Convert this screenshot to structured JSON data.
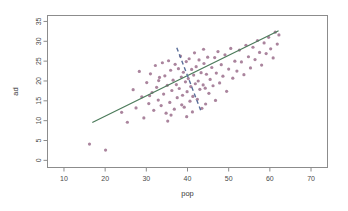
{
  "chart_data": {
    "type": "scatter",
    "title": "",
    "xlabel": "pop",
    "ylabel": "ad",
    "xlim": [
      6,
      74
    ],
    "ylim": [
      -1.8,
      36.5
    ],
    "xticks": [
      10,
      20,
      30,
      40,
      50,
      60,
      70
    ],
    "yticks": [
      0,
      5,
      10,
      15,
      20,
      25,
      30,
      35
    ],
    "xtick_labels": [
      "10",
      "20",
      "30",
      "40",
      "50",
      "60",
      "70"
    ],
    "ytick_labels": [
      "0",
      "5",
      "10",
      "15",
      "20",
      "25",
      "30",
      "35"
    ],
    "grid": false,
    "legend": null,
    "point_color": "#9b6e8c",
    "point_radius": 1.6,
    "series": [
      {
        "name": "observations",
        "color": "#9b6e8c",
        "x": [
          16.2,
          20.1,
          24.0,
          25.4,
          26.8,
          27.5,
          28.3,
          28.9,
          29.4,
          30.1,
          30.6,
          31.0,
          31.4,
          31.8,
          32.2,
          32.5,
          32.9,
          33.2,
          33.6,
          33.9,
          34.2,
          34.5,
          34.8,
          35.1,
          35.4,
          35.7,
          35.9,
          36.2,
          36.5,
          36.8,
          37.0,
          37.3,
          37.5,
          37.8,
          38.0,
          38.3,
          38.5,
          38.8,
          39.0,
          39.2,
          39.5,
          39.7,
          39.9,
          40.2,
          40.4,
          40.6,
          40.8,
          41.0,
          41.3,
          41.5,
          41.7,
          41.9,
          42.1,
          42.4,
          42.6,
          42.8,
          43.0,
          43.3,
          43.5,
          43.8,
          44.0,
          44.3,
          44.6,
          44.9,
          45.2,
          45.5,
          45.9,
          46.2,
          46.6,
          47.0,
          47.4,
          47.8,
          48.2,
          48.6,
          49.1,
          49.5,
          50.0,
          50.5,
          51.0,
          51.5,
          52.0,
          52.6,
          53.1,
          53.7,
          54.2,
          54.8,
          55.3,
          55.9,
          56.4,
          57.0,
          57.5,
          58.0,
          58.6,
          59.1,
          59.7,
          60.2,
          60.8,
          61.3,
          61.8,
          62.2,
          33.0,
          36.0,
          38.6,
          41.2,
          43.9,
          46.8,
          30.8,
          35.2,
          39.8,
          44.4
        ],
        "y": [
          4.1,
          2.6,
          12.1,
          9.6,
          17.8,
          13.2,
          22.4,
          16.0,
          10.7,
          19.6,
          14.3,
          21.8,
          17.1,
          12.6,
          23.9,
          18.4,
          15.2,
          20.9,
          13.8,
          24.6,
          16.7,
          21.3,
          11.9,
          18.9,
          25.1,
          14.6,
          22.7,
          17.6,
          20.2,
          12.9,
          24.2,
          19.1,
          15.8,
          23.1,
          18.1,
          26.3,
          21.0,
          16.4,
          22.2,
          13.4,
          19.8,
          24.9,
          17.3,
          20.6,
          25.6,
          14.9,
          18.6,
          22.9,
          16.1,
          21.5,
          27.1,
          19.3,
          23.6,
          15.4,
          20.0,
          25.3,
          17.9,
          22.1,
          13.1,
          19.0,
          24.4,
          18.2,
          21.7,
          26.0,
          16.9,
          20.4,
          23.4,
          18.8,
          25.9,
          22.0,
          27.4,
          19.5,
          24.1,
          21.2,
          26.6,
          17.4,
          23.0,
          28.2,
          20.7,
          25.0,
          22.5,
          27.8,
          24.8,
          21.6,
          29.0,
          26.1,
          23.3,
          28.5,
          25.4,
          30.2,
          27.2,
          24.0,
          29.6,
          26.9,
          31.0,
          28.1,
          25.8,
          32.3,
          29.3,
          31.6,
          20.1,
          11.4,
          14.0,
          12.2,
          28.0,
          15.1,
          16.3,
          9.9,
          11.0,
          14.2
        ]
      }
    ],
    "annotations": [
      {
        "kind": "fit-line",
        "name": "regression-line",
        "color": "#4d7c5c",
        "style": "solid",
        "width": 1.3,
        "x0": 17.0,
        "y0": 9.6,
        "x1": 62.0,
        "y1": 32.6
      },
      {
        "kind": "reference-line",
        "name": "dashed-reference-line",
        "color": "#5a6f9a",
        "style": "dashed",
        "width": 1.4,
        "dash": "4 3",
        "x0": 37.4,
        "y0": 28.4,
        "x1": 43.2,
        "y1": 12.6
      }
    ]
  }
}
